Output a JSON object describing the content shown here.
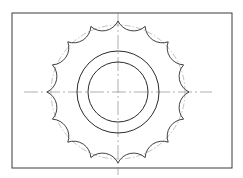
{
  "caption": "",
  "drawing": {
    "frame": {
      "x": 12,
      "y": 13,
      "width": 220,
      "height": 155
    },
    "center": {
      "x": 118,
      "y": 92
    },
    "tooth_count": 16,
    "tip_radius": 71,
    "pitch_circle_radius": 67,
    "scallop_depth": 7,
    "outer_bore_radius": 41,
    "inner_bore_radius": 30,
    "center_line_h": {
      "x1": 24,
      "x2": 212
    },
    "center_line_v": {
      "y1": 13,
      "y2": 175
    },
    "colors": {
      "line": "#2b2b2b",
      "frame": "#3a3a3a",
      "construction": "#9a9a9a"
    }
  }
}
